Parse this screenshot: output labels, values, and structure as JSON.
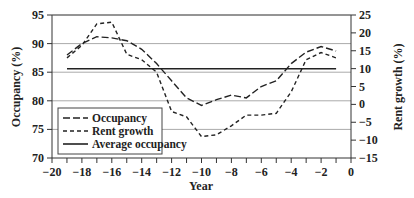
{
  "chart_data": {
    "type": "line",
    "title": "",
    "xlabel": "Year",
    "ylabel": "Occupancy (%)",
    "y2label": "Rent growth (%)",
    "xlim": [
      -20,
      0
    ],
    "ylim": [
      70,
      95
    ],
    "y2lim": [
      -15,
      25
    ],
    "x_ticks": [
      -20,
      -18,
      -16,
      -14,
      -12,
      -10,
      -8,
      -6,
      -4,
      -2,
      0
    ],
    "y_ticks": [
      70,
      75,
      80,
      85,
      90,
      95
    ],
    "y2_ticks": [
      -15,
      -10,
      -5,
      0,
      5,
      10,
      15,
      20,
      25
    ],
    "grid": "horizontal lines at left-axis ticks",
    "legend_position": "lower left",
    "x": [
      -19,
      -18,
      -17,
      -16,
      -15,
      -14,
      -13,
      -12,
      -11,
      -10,
      -9,
      -8,
      -7,
      -6,
      -5,
      -4,
      -3,
      -2,
      -1
    ],
    "series": [
      {
        "name": "Occupancy",
        "axis": "left",
        "style": "long-dash",
        "values": [
          88.0,
          90.0,
          91.2,
          91.0,
          90.5,
          89.0,
          86.5,
          83.5,
          80.5,
          79.2,
          80.2,
          81.0,
          80.5,
          82.5,
          83.5,
          86.5,
          88.5,
          89.5,
          88.7
        ]
      },
      {
        "name": "Rent growth",
        "axis": "right",
        "style": "short-dash",
        "values": [
          13.0,
          16.5,
          22.5,
          23.0,
          14.0,
          12.5,
          9.0,
          -2.0,
          -3.5,
          -9.0,
          -8.5,
          -6.0,
          -3.0,
          -3.0,
          -2.5,
          3.5,
          12.5,
          14.5,
          13.0
        ]
      },
      {
        "name": "Average occupancy",
        "axis": "left",
        "style": "solid",
        "values": [
          85.6,
          85.6,
          85.6,
          85.6,
          85.6,
          85.6,
          85.6,
          85.6,
          85.6,
          85.6,
          85.6,
          85.6,
          85.6,
          85.6,
          85.6,
          85.6,
          85.6,
          85.6,
          85.6
        ]
      }
    ]
  },
  "labels": {
    "xlabel": "Year",
    "ylabel": "Occupancy (%)",
    "y2label": "Rent growth (%)",
    "legend": [
      "Occupancy",
      "Rent growth",
      "Average occupancy"
    ]
  }
}
